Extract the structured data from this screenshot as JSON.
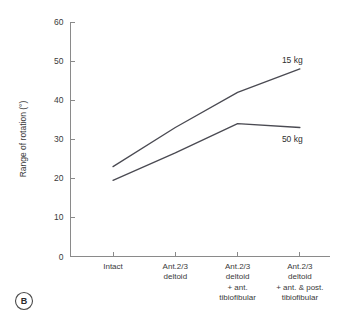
{
  "panel": {
    "marker": "B"
  },
  "chart_data": {
    "type": "line",
    "title": "",
    "subtitle": "",
    "xlabel": "",
    "ylabel": "Range of rotation (°)",
    "ylim": [
      0,
      60
    ],
    "yticks": [
      0,
      10,
      20,
      30,
      40,
      50,
      60
    ],
    "ytick_labels": [
      "0",
      "10",
      "20",
      "30",
      "40",
      "50",
      "60"
    ],
    "grid": false,
    "legend_position": "inline-right",
    "categories": [
      "Intact",
      "Ant.2/3 deltoid",
      "Ant.2/3 deltoid + ant. tibiofibular",
      "Ant.2/3 deltoid + ant. & post. tibiofibular"
    ],
    "category_lines": [
      [
        "Intact"
      ],
      [
        "Ant.2/3",
        "deltoid"
      ],
      [
        "Ant.2/3",
        "deltoid",
        "+ ant.",
        "tibiofibular"
      ],
      [
        "Ant.2/3",
        "deltoid",
        "+ ant. & post.",
        "tibiofibular"
      ]
    ],
    "series": [
      {
        "name": "15 kg",
        "label": "15 kg",
        "values": [
          23.0,
          33.0,
          42.0,
          48.0
        ]
      },
      {
        "name": "50 kg",
        "label": "50 kg",
        "values": [
          19.5,
          26.5,
          34.0,
          33.0
        ]
      }
    ],
    "colors": {
      "series_15kg": "#4a4a52",
      "series_50kg": "#4a4a52",
      "axis": "#8a8a8a",
      "text": "#3a3a3a"
    }
  }
}
